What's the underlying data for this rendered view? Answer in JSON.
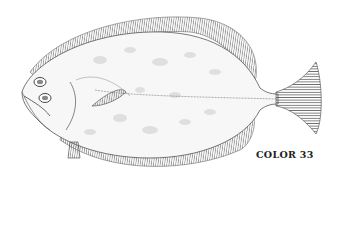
{
  "figure": {
    "caption": "COLOR 33",
    "colors": {
      "ink": "#3a3a3a",
      "fin": "#8a8a8a",
      "spots": "#cfcfcf",
      "background": "#ffffff"
    }
  }
}
